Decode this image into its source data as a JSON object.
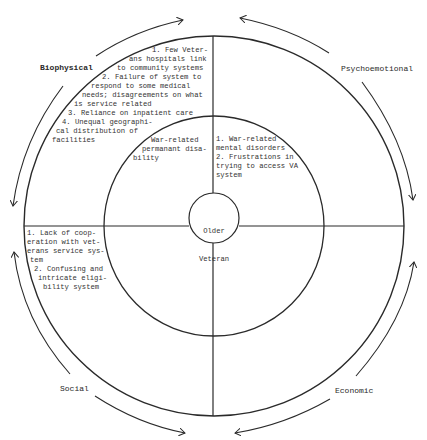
{
  "diagram": {
    "center_label": [
      "Older",
      "Veteran"
    ],
    "domains": {
      "biophysical": "Biophysical",
      "psychoemotional": "Psychoemotional",
      "social": "Social",
      "economic": "Economic"
    },
    "quadrants": {
      "biophysical_outer": [
        "1. Few Veter-",
        "ans hospitals link",
        "to community systems",
        "2. Failure of system to",
        "respond to some medical",
        "needs; disagreements on what",
        "is service related",
        "3. Reliance on inpatient care",
        "4. Unequal geographi-",
        "cal distribution of",
        "facilities"
      ],
      "biophysical_inner": [
        "War-related",
        "permanant disa-",
        "bility"
      ],
      "psychoemotional_inner": [
        "1. War-related",
        "mental disorders",
        "2. Frustrations in",
        "trying to access VA",
        "system"
      ],
      "social_outer": [
        "1. Lack of coop-",
        "eration with vet-",
        "erans service sys-",
        "tem",
        "2. Confusing and",
        "intricate eligi-",
        "bility system"
      ]
    },
    "colors": {
      "line": "#2a2a2a",
      "background": "#ffffff"
    }
  }
}
